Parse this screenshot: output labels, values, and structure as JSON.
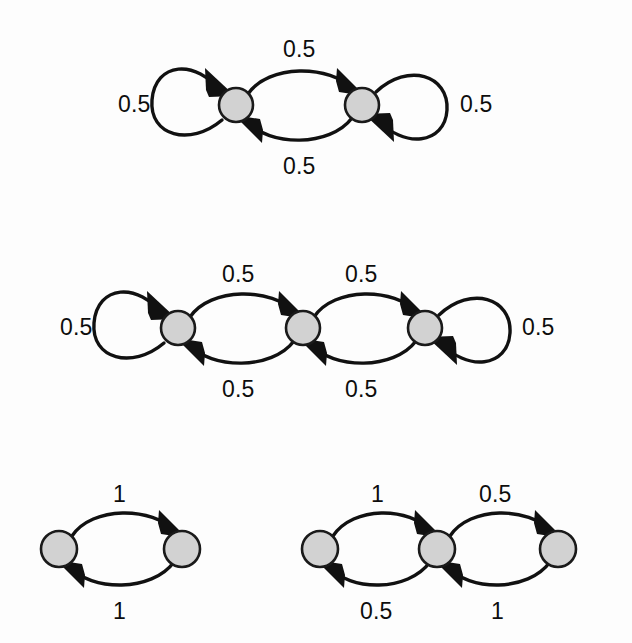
{
  "figure": {
    "type": "markov-chain-state-diagrams",
    "background_color": "#fdfdfd",
    "node_fill_color": "#d2d2d2",
    "node_stroke_color": "#1a1a1a",
    "edge_color": "#111111",
    "label_color": "#0d0d0d"
  },
  "diagrams": [
    {
      "id": "diagram-1",
      "name": "two-state-chain-with-self-loops",
      "node_count": 2,
      "nodes": [
        {
          "id": "d1-n1",
          "cx": 236,
          "cy": 105,
          "r": 17
        },
        {
          "id": "d1-n2",
          "cx": 362,
          "cy": 105,
          "r": 17
        }
      ],
      "labels": [
        {
          "id": "d1-l-left-loop",
          "text": "0.5",
          "x": 118,
          "y": 93,
          "edge": "self-loop-left"
        },
        {
          "id": "d1-l-top",
          "text": "0.5",
          "x": 283,
          "y": 38,
          "edge": "n1-to-n2"
        },
        {
          "id": "d1-l-bottom",
          "text": "0.5",
          "x": 283,
          "y": 155,
          "edge": "n2-to-n1"
        },
        {
          "id": "d1-l-right-loop",
          "text": "0.5",
          "x": 460,
          "y": 93,
          "edge": "self-loop-right"
        }
      ],
      "transitions": [
        {
          "from": "d1-n1",
          "to": "d1-n1",
          "weight": "0.5"
        },
        {
          "from": "d1-n1",
          "to": "d1-n2",
          "weight": "0.5"
        },
        {
          "from": "d1-n2",
          "to": "d1-n1",
          "weight": "0.5"
        },
        {
          "from": "d1-n2",
          "to": "d1-n2",
          "weight": "0.5"
        }
      ]
    },
    {
      "id": "diagram-2",
      "name": "three-state-chain-with-end-self-loops",
      "node_count": 3,
      "nodes": [
        {
          "id": "d2-n1",
          "cx": 178,
          "cy": 328,
          "r": 17
        },
        {
          "id": "d2-n2",
          "cx": 303,
          "cy": 328,
          "r": 17
        },
        {
          "id": "d2-n3",
          "cx": 425,
          "cy": 328,
          "r": 17
        }
      ],
      "labels": [
        {
          "id": "d2-l-left-loop",
          "text": "0.5",
          "x": 60,
          "y": 316,
          "edge": "self-loop-left"
        },
        {
          "id": "d2-l-top-1",
          "text": "0.5",
          "x": 222,
          "y": 263,
          "edge": "n1-to-n2"
        },
        {
          "id": "d2-l-top-2",
          "text": "0.5",
          "x": 345,
          "y": 263,
          "edge": "n2-to-n3"
        },
        {
          "id": "d2-l-bottom-1",
          "text": "0.5",
          "x": 222,
          "y": 378,
          "edge": "n2-to-n1"
        },
        {
          "id": "d2-l-bottom-2",
          "text": "0.5",
          "x": 345,
          "y": 378,
          "edge": "n3-to-n2"
        },
        {
          "id": "d2-l-right-loop",
          "text": "0.5",
          "x": 522,
          "y": 316,
          "edge": "self-loop-right"
        }
      ],
      "transitions": [
        {
          "from": "d2-n1",
          "to": "d2-n1",
          "weight": "0.5"
        },
        {
          "from": "d2-n1",
          "to": "d2-n2",
          "weight": "0.5"
        },
        {
          "from": "d2-n2",
          "to": "d2-n1",
          "weight": "0.5"
        },
        {
          "from": "d2-n2",
          "to": "d2-n3",
          "weight": "0.5"
        },
        {
          "from": "d2-n3",
          "to": "d2-n2",
          "weight": "0.5"
        },
        {
          "from": "d2-n3",
          "to": "d2-n3",
          "weight": "0.5"
        }
      ]
    },
    {
      "id": "diagram-3",
      "name": "two-state-deterministic-cycle",
      "node_count": 2,
      "nodes": [
        {
          "id": "d3-n1",
          "cx": 59,
          "cy": 549,
          "r": 18
        },
        {
          "id": "d3-n2",
          "cx": 182,
          "cy": 549,
          "r": 18
        }
      ],
      "labels": [
        {
          "id": "d3-l-top",
          "text": "1",
          "x": 113,
          "y": 483,
          "edge": "n1-to-n2"
        },
        {
          "id": "d3-l-bottom",
          "text": "1",
          "x": 113,
          "y": 600,
          "edge": "n2-to-n1"
        }
      ],
      "transitions": [
        {
          "from": "d3-n1",
          "to": "d3-n2",
          "weight": "1"
        },
        {
          "from": "d3-n2",
          "to": "d3-n1",
          "weight": "1"
        }
      ]
    },
    {
      "id": "diagram-4",
      "name": "three-state-chain-mixed-weights",
      "node_count": 3,
      "nodes": [
        {
          "id": "d4-n1",
          "cx": 320,
          "cy": 549,
          "r": 18
        },
        {
          "id": "d4-n2",
          "cx": 437,
          "cy": 549,
          "r": 18
        },
        {
          "id": "d4-n3",
          "cx": 558,
          "cy": 549,
          "r": 18
        }
      ],
      "labels": [
        {
          "id": "d4-l-top-1",
          "text": "1",
          "x": 371,
          "y": 483,
          "edge": "n1-to-n2"
        },
        {
          "id": "d4-l-top-2",
          "text": "0.5",
          "x": 479,
          "y": 483,
          "edge": "n2-to-n3"
        },
        {
          "id": "d4-l-bottom-1",
          "text": "0.5",
          "x": 360,
          "y": 600,
          "edge": "n2-to-n1"
        },
        {
          "id": "d4-l-bottom-2",
          "text": "1",
          "x": 491,
          "y": 600,
          "edge": "n3-to-n2"
        }
      ],
      "transitions": [
        {
          "from": "d4-n1",
          "to": "d4-n2",
          "weight": "1"
        },
        {
          "from": "d4-n2",
          "to": "d4-n1",
          "weight": "0.5"
        },
        {
          "from": "d4-n2",
          "to": "d4-n3",
          "weight": "0.5"
        },
        {
          "from": "d4-n3",
          "to": "d4-n2",
          "weight": "1"
        }
      ]
    }
  ]
}
